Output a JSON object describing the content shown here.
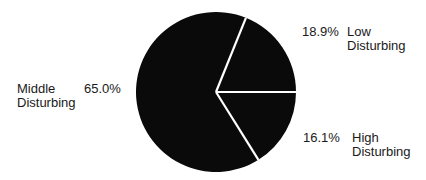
{
  "chart_data": {
    "type": "pie",
    "title": "",
    "slices": [
      {
        "label": "Low Disturbing",
        "value": 18.9,
        "display": "18.9%"
      },
      {
        "label": "High Disturbing",
        "value": 16.1,
        "display": "16.1%"
      },
      {
        "label": "Middle Disturbing",
        "value": 65.0,
        "display": "65.0%"
      }
    ],
    "units": "%",
    "colors": {
      "fill": "#0a0a0a",
      "separator": "#ffffff"
    },
    "legend": "none (labels placed beside slices)"
  },
  "labels": {
    "low": {
      "pct": "18.9%",
      "line1": "Low",
      "line2": "Disturbing"
    },
    "high": {
      "pct": "16.1%",
      "line1": "High",
      "line2": "Disturbing"
    },
    "middle": {
      "pct": "65.0%",
      "line1": "Middle",
      "line2": "Disturbing"
    }
  }
}
